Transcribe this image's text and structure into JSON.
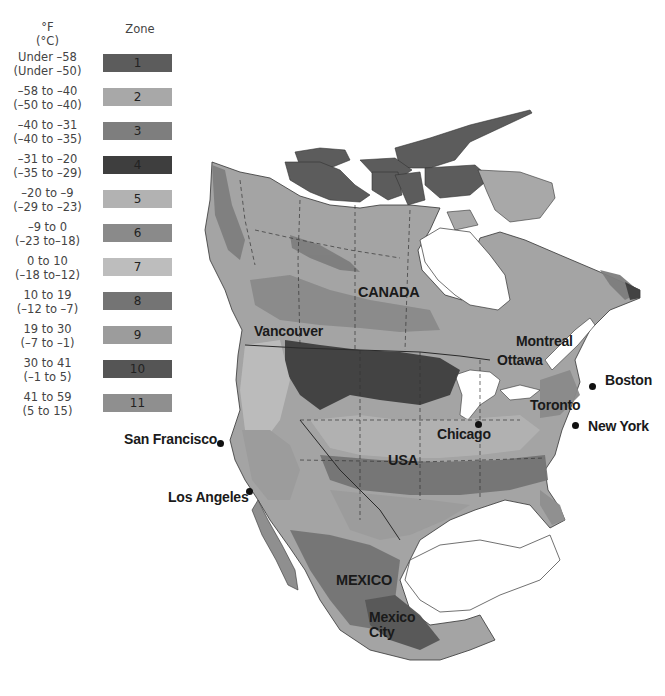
{
  "legend": {
    "temp_header_f": "°F",
    "temp_header_c": "(°C)",
    "zone_header": "Zone",
    "items": [
      {
        "zone": "1",
        "range_f": "Under –58",
        "range_c": "(Under –50)",
        "color": "#5c5c5c"
      },
      {
        "zone": "2",
        "range_f": "–58 to –40",
        "range_c": "(–50 to –40)",
        "color": "#a8a8a8"
      },
      {
        "zone": "3",
        "range_f": "–40 to –31",
        "range_c": "(–40 to –35)",
        "color": "#7e7e7e"
      },
      {
        "zone": "4",
        "range_f": "–31 to –20",
        "range_c": "(–35 to –29)",
        "color": "#3e3e3e"
      },
      {
        "zone": "5",
        "range_f": "–20 to  –9",
        "range_c": "(–29 to –23)",
        "color": "#b2b2b2"
      },
      {
        "zone": "6",
        "range_f": "–9 to   0",
        "range_c": "(–23 to–18)",
        "color": "#8a8a8a"
      },
      {
        "zone": "7",
        "range_f": "0 to  10",
        "range_c": "(–18 to–12)",
        "color": "#bdbdbd"
      },
      {
        "zone": "8",
        "range_f": "10 to  19",
        "range_c": "(–12 to  –7)",
        "color": "#747474"
      },
      {
        "zone": "9",
        "range_f": "19 to  30",
        "range_c": "(–7 to  –1)",
        "color": "#9c9c9c"
      },
      {
        "zone": "10",
        "range_f": "30 to  41",
        "range_c": "(–1 to    5)",
        "color": "#555555"
      },
      {
        "zone": "11",
        "range_f": "41 to  59",
        "range_c": "(5 to  15)",
        "color": "#8f8f8f"
      }
    ]
  },
  "map": {
    "countries": [
      {
        "name": "CANADA"
      },
      {
        "name": "USA"
      },
      {
        "name": "MEXICO"
      }
    ],
    "cities": [
      {
        "name": "Vancouver"
      },
      {
        "name": "Montreal"
      },
      {
        "name": "Ottawa"
      },
      {
        "name": "Boston"
      },
      {
        "name": "Toronto"
      },
      {
        "name": "New York"
      },
      {
        "name": "Chicago"
      },
      {
        "name": "San Francisco"
      },
      {
        "name": "Los Angeles"
      },
      {
        "name": "Mexico City"
      }
    ]
  }
}
